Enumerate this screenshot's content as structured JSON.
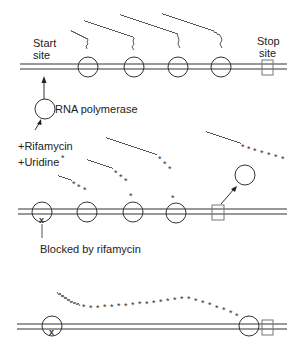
{
  "labels": {
    "start_site_1": "Start",
    "start_site_2": "site",
    "stop_site_1": "Stop",
    "stop_site_2": "site",
    "rna_polymerase": "RNA polymerase",
    "rifamycin": "+Rifamycin",
    "uridine": "+Uridine",
    "uridine_mark": "*",
    "blocked": "Blocked by rifamycin"
  },
  "colors": {
    "line": "#333333",
    "square": "#777777",
    "background": "#ffffff"
  }
}
